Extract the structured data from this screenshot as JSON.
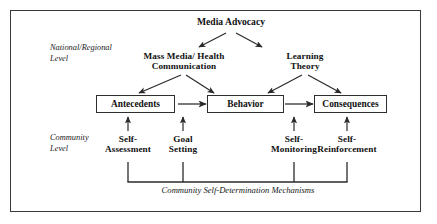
{
  "figure": {
    "top_node": "Media Advocacy",
    "level_labels": {
      "national": "National/Regional\nLevel",
      "national_line1": "National/Regional",
      "national_line2": "Level",
      "community_line1": "Community",
      "community_line2": "Level"
    },
    "mid_nodes": {
      "mass_media_line1": "Mass Media/ Health",
      "mass_media_line2": "Communication",
      "learning_line1": "Learning",
      "learning_line2": "Theory"
    },
    "chain_boxes": [
      {
        "label": "Antecedents"
      },
      {
        "label": "Behavior"
      },
      {
        "label": "Consequences"
      }
    ],
    "mechanisms": [
      {
        "line1": "Self-",
        "line2": "Assessment"
      },
      {
        "line1": "Goal",
        "line2": "Setting"
      },
      {
        "line1": "Self-",
        "line2": "Monitoring"
      },
      {
        "line1": "Self-",
        "line2": "Reinforcement"
      }
    ],
    "bracket_caption": "Community Self-Determination Mechanisms",
    "colors": {
      "stroke": "#2e2e2e",
      "frame": "#3a3a3a",
      "text": "#101010",
      "background": "#ffffff"
    }
  }
}
